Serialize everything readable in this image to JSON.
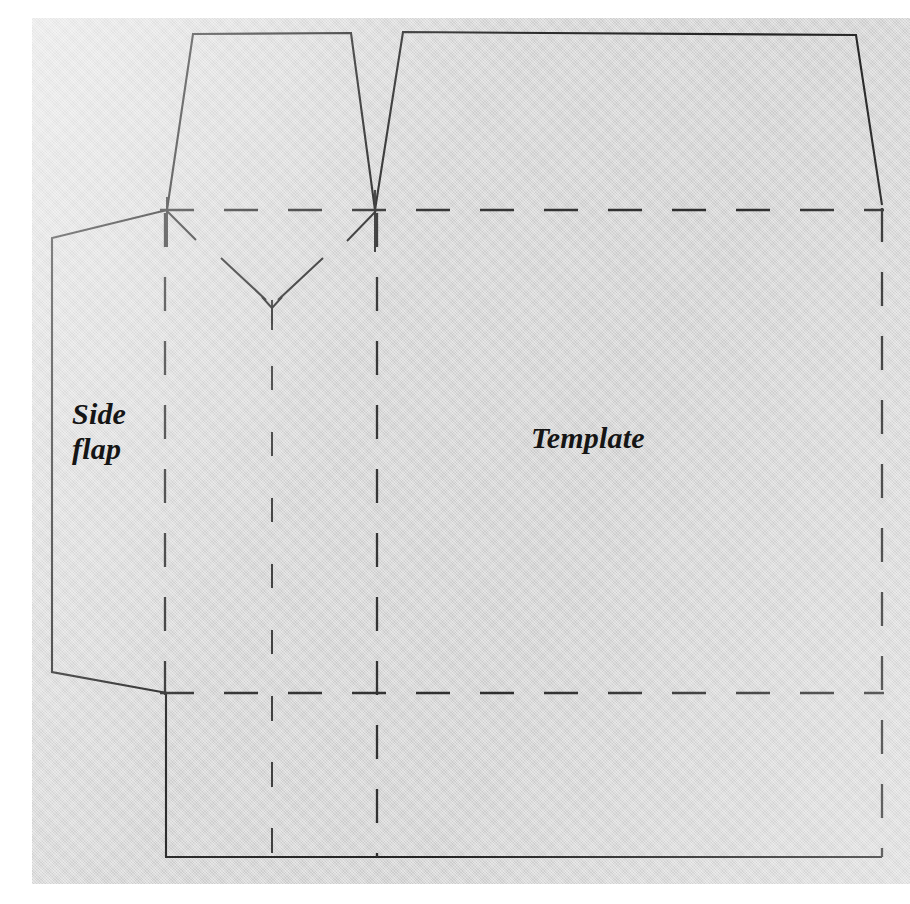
{
  "document": {
    "kind": "papercraft-box-template-diagram",
    "background_color": "#d7d7d7",
    "line_color": "#232323",
    "margin_color": "#ffffff"
  },
  "labels": {
    "side_flap": "Side\nflap",
    "template": "Template"
  },
  "legend": {
    "solid_meaning": "cut line",
    "dashed_meaning": "fold line"
  },
  "geometry": {
    "paper": {
      "x": 32,
      "y": 18,
      "width": 878,
      "height": 866
    },
    "fold_lines_horizontal_y": [
      210,
      693
    ],
    "fold_lines_vertical_x": [
      165,
      272,
      377,
      882
    ],
    "cut_outline_points": "193,34 351,33 375,210 403,32 856,35 882,205",
    "bottom_cut_y": 857,
    "side_flap_outline": "167,210 52,238 52,672 167,693"
  },
  "shapes": {
    "tab_left": {
      "name": "left-top-tab",
      "top_left_x": 193,
      "top_right_x": 351,
      "top_y": 34
    },
    "tab_right": {
      "name": "right-top-panel",
      "top_left_x": 403,
      "top_right_x": 856,
      "top_y": 33
    },
    "notch": {
      "name": "center-v-notch",
      "apex_x": 272,
      "apex_y": 300
    }
  }
}
